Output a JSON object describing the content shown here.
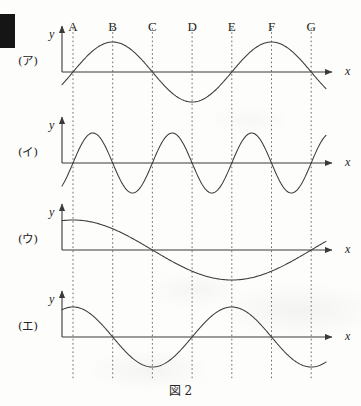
{
  "figure": {
    "caption": "図 2",
    "caption_y": 381,
    "width": 361,
    "height": 406,
    "background_color": "#fdfdfc",
    "ink_color": "#3a3a3a",
    "text_color": "#232323",
    "gridline_color": "#5b5b5b"
  },
  "artifact": {
    "name": "scan-binding-mark",
    "color": "#151515",
    "x": 0,
    "y": 14,
    "width": 15,
    "height": 34
  },
  "geometry": {
    "axis_x": 62,
    "grid_start_x": 73,
    "grid_spacing": 39.7,
    "axis_arrow_end_x": 332,
    "curve_end_x": 326,
    "letters_y": 20,
    "y_axis_height": 46,
    "y_label_dx": -13,
    "y_label_dy": -40,
    "x_label_dx": 13,
    "x_label_dy": 0,
    "panel_label_x": 18
  },
  "reference_lines": {
    "axis_label_x": "x",
    "axis_label_y": "y",
    "letters": [
      {
        "label": "A",
        "index": 0,
        "x": 73
      },
      {
        "label": "B",
        "index": 1,
        "x": 112.7
      },
      {
        "label": "C",
        "index": 2,
        "x": 152.4
      },
      {
        "label": "D",
        "index": 3,
        "x": 192.1
      },
      {
        "label": "E",
        "index": 4,
        "x": 231.8
      },
      {
        "label": "F",
        "index": 5,
        "x": 271.5
      },
      {
        "label": "G",
        "index": 6,
        "x": 311.2
      }
    ]
  },
  "chart_data": {
    "type": "line",
    "title": "図 2",
    "xlabel": "x",
    "ylabel": "y",
    "grid": true,
    "legend_position": "left",
    "x_tick_labels": [
      "A",
      "B",
      "C",
      "D",
      "E",
      "F",
      "G"
    ],
    "x_tick_units": [
      1,
      2,
      3,
      4,
      5,
      6,
      7
    ],
    "series": [
      {
        "name": "(ア)",
        "panel_index": 0,
        "baseline_y": 72,
        "amplitude_px": 30,
        "period_units": 4,
        "form": "y = -A sin(2*pi*(x-1)/4)",
        "phase_zero_at": "A",
        "features": [
          {
            "type": "zero-descending",
            "at": "A"
          },
          {
            "type": "trough",
            "at": "C"
          },
          {
            "type": "zero-ascending",
            "at": "E"
          },
          {
            "type": "peak",
            "at": "G"
          }
        ]
      },
      {
        "name": "(イ)",
        "panel_index": 1,
        "baseline_y": 163,
        "amplitude_px": 30,
        "period_units": 2,
        "form": "y = -A sin(2*pi*(x-1)/2)",
        "phase_zero_at": "A",
        "features": [
          {
            "type": "zero-descending",
            "at": "A"
          },
          {
            "type": "trough",
            "at": "B"
          },
          {
            "type": "zero-ascending",
            "at": "C"
          },
          {
            "type": "peak",
            "at": "D"
          },
          {
            "type": "zero-descending",
            "at": "E"
          },
          {
            "type": "trough",
            "at": "F"
          },
          {
            "type": "zero-ascending",
            "at": "G"
          }
        ]
      },
      {
        "name": "(ウ)",
        "panel_index": 2,
        "baseline_y": 250,
        "amplitude_px": 30,
        "period_units": 8,
        "form": "y = -A cos(2*pi*(x-1)/8)",
        "phase_zero_at": "C",
        "features": [
          {
            "type": "trough",
            "at": "A"
          },
          {
            "type": "zero-ascending",
            "at": "C"
          },
          {
            "type": "peak",
            "at": "E"
          },
          {
            "type": "zero-descending",
            "at": "G"
          }
        ]
      },
      {
        "name": "(エ)",
        "panel_index": 3,
        "baseline_y": 337,
        "amplitude_px": 30,
        "period_units": 4,
        "form": "y = -A cos(2*pi*(x-1)/4)",
        "phase_zero_at": "B",
        "features": [
          {
            "type": "trough",
            "at": "A"
          },
          {
            "type": "zero-ascending",
            "at": "B"
          },
          {
            "type": "peak",
            "at": "C"
          },
          {
            "type": "zero-descending",
            "at": "D"
          },
          {
            "type": "trough",
            "at": "E"
          },
          {
            "type": "zero-ascending",
            "at": "F"
          },
          {
            "type": "peak",
            "at": "G"
          }
        ]
      }
    ]
  }
}
